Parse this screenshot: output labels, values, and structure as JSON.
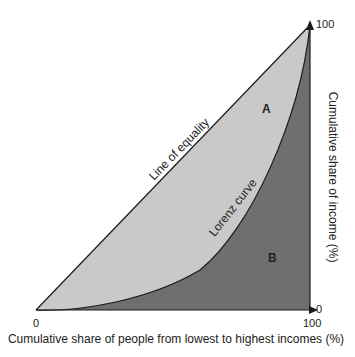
{
  "diagram": {
    "type": "lorenz-curve",
    "x_axis": {
      "label": "Cumulative share of people from lowest to highest incomes (%)",
      "min_label": "0",
      "max_label": "100"
    },
    "y_axis": {
      "label": "Cumulative share of income (%)",
      "min_label": "0",
      "max_label": "100"
    },
    "curves": {
      "equality_label": "Line of equality",
      "lorenz_label": "Lorenz curve"
    },
    "regions": {
      "a_label": "A",
      "b_label": "B"
    },
    "colors": {
      "region_a": "#c9c9c9",
      "region_b": "#6f6f6f",
      "lines": "#1a1a1a"
    }
  }
}
